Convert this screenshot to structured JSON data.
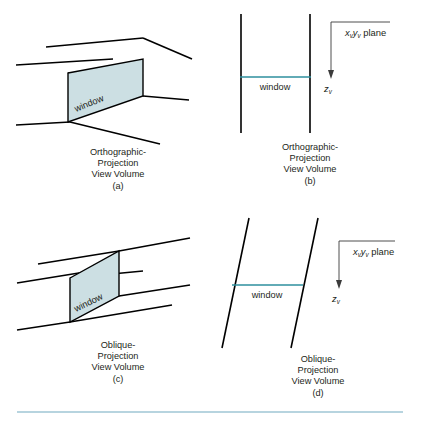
{
  "figure": {
    "title_present": false,
    "background_color": "#ffffff",
    "window_fill_color": "#ccdfe3",
    "window_stroke_color": "#000000",
    "line_color": "#000000",
    "teal_color": "#2e8f9e",
    "separator_color": "#9fc6d4",
    "text_color": "#231f20"
  },
  "panels": [
    {
      "id": "a",
      "name": "orthographic-projection-3d",
      "window_label": "window",
      "caption_lines": [
        "Orthographic-",
        "Projection",
        "View Volume"
      ],
      "caption_tag": "(a)"
    },
    {
      "id": "b",
      "name": "orthographic-projection-side",
      "window_label": "window",
      "caption_lines": [
        "Orthographic-",
        "Projection",
        "View Volume"
      ],
      "caption_tag": "(b)",
      "axis": {
        "plane_label_base": "plane",
        "plane_x": "x",
        "plane_x_sub": "v",
        "plane_y": "y",
        "plane_y_sub": "v",
        "depth_axis": "z",
        "depth_axis_sub": "v"
      }
    },
    {
      "id": "c",
      "name": "oblique-projection-3d",
      "window_label": "window",
      "caption_lines": [
        "Oblique-",
        "Projection",
        "View Volume"
      ],
      "caption_tag": "(c)"
    },
    {
      "id": "d",
      "name": "oblique-projection-side",
      "window_label": "window",
      "caption_lines": [
        "Oblique-",
        "Projection",
        "View Volume"
      ],
      "caption_tag": "(d)",
      "axis": {
        "plane_label_base": "plane",
        "plane_x": "x",
        "plane_x_sub": "v",
        "plane_y": "y",
        "plane_y_sub": "v",
        "depth_axis": "z",
        "depth_axis_sub": "v"
      }
    }
  ]
}
